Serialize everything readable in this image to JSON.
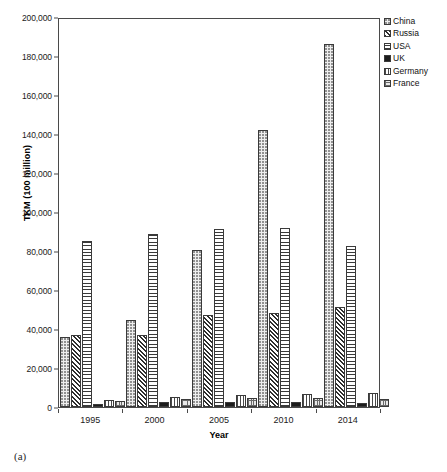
{
  "figure": {
    "caption": "(a)"
  },
  "chart_data": {
    "type": "bar",
    "title": "",
    "subtitle": "",
    "xlabel": "Year",
    "ylabel": "TKM (100 million)",
    "categories": [
      "1995",
      "2000",
      "2005",
      "2010",
      "2014"
    ],
    "ylim": [
      0,
      200000
    ],
    "ytick_step": 20000,
    "yticks": [
      "0",
      "20,000",
      "40,000",
      "60,000",
      "80,000",
      "100,000",
      "120,000",
      "140,000",
      "160,000",
      "180,000",
      "200,000"
    ],
    "ytick_values": [
      0,
      20000,
      40000,
      60000,
      80000,
      100000,
      120000,
      140000,
      160000,
      180000,
      200000
    ],
    "grid": false,
    "legend_position": "right-top",
    "series": [
      {
        "name": "China",
        "pattern": "light-dotted",
        "values": [
          36000,
          44500,
          80500,
          142000,
          186000
        ]
      },
      {
        "name": "Russia",
        "pattern": "dark-diagonal-hatch",
        "values": [
          37000,
          37000,
          47000,
          48000,
          51500
        ]
      },
      {
        "name": "USA",
        "pattern": "horizontal-dashes",
        "values": [
          85000,
          88500,
          91500,
          92000,
          82500
        ]
      },
      {
        "name": "UK",
        "pattern": "solid-dark",
        "values": [
          1500,
          2400,
          2700,
          2500,
          2300
        ]
      },
      {
        "name": "Germany",
        "pattern": "vertical-lines",
        "values": [
          3600,
          5200,
          6200,
          6800,
          7100
        ]
      },
      {
        "name": "France",
        "pattern": "cross-hatch",
        "values": [
          3300,
          4200,
          4400,
          4400,
          4200
        ]
      }
    ]
  },
  "legend": {
    "items": [
      {
        "label": "China",
        "series_key": "china"
      },
      {
        "label": "Russia",
        "series_key": "russia"
      },
      {
        "label": "USA",
        "series_key": "usa"
      },
      {
        "label": "UK",
        "series_key": "uk"
      },
      {
        "label": "Germany",
        "series_key": "germany"
      },
      {
        "label": "France",
        "series_key": "france"
      }
    ]
  },
  "colors": {
    "axis": "#4a4a4a",
    "text": "#1a1a1a",
    "background": "#ffffff",
    "china": "#eeeeee",
    "russia": "#2e2e2e",
    "usa": "#ffffff",
    "uk": "#1c1c1c",
    "germany": "#fafafa",
    "france": "#e9e9e9"
  }
}
